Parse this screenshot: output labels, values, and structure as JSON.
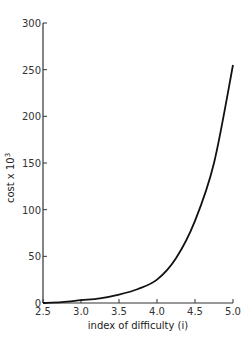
{
  "chart_data": {
    "type": "line",
    "title": "",
    "xlabel": "index of difficulty (i)",
    "ylabel": "cost x 10",
    "ylabel_superscript": "3",
    "xlim": [
      2.5,
      5.0
    ],
    "ylim": [
      0,
      300
    ],
    "grid": false,
    "legend": null,
    "x_ticks": [
      "2.5",
      "3.0",
      "3.5",
      "4.0",
      "4.5",
      "5.0"
    ],
    "y_ticks": [
      "0",
      "50",
      "100",
      "150",
      "200",
      "250",
      "300"
    ],
    "series": [
      {
        "name": "cost",
        "x": [
          2.5,
          2.75,
          3.0,
          3.25,
          3.5,
          3.75,
          4.0,
          4.25,
          4.5,
          4.75,
          5.0
        ],
        "y": [
          0,
          1,
          3,
          5,
          9,
          15,
          25,
          48,
          88,
          150,
          255
        ]
      }
    ]
  }
}
